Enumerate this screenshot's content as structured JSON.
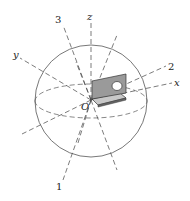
{
  "figure": {
    "type": "3D coordinate diagram with sphere and bracket part",
    "origin_label": "O",
    "axes": [
      {
        "label": "x",
        "role": "cartesian axis"
      },
      {
        "label": "y",
        "role": "cartesian axis"
      },
      {
        "label": "z",
        "role": "cartesian axis"
      }
    ],
    "directions": [
      {
        "label": "1",
        "role": "numbered direction"
      },
      {
        "label": "2",
        "role": "numbered direction"
      },
      {
        "label": "3",
        "role": "numbered direction"
      }
    ],
    "colors": {
      "line": "#444444",
      "part_face": "#9a9a9a",
      "part_face_light": "#c8c8c8",
      "part_edge": "#333333"
    }
  }
}
